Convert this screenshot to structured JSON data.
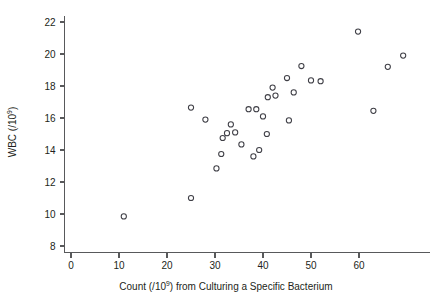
{
  "chart_data": {
    "type": "scatter",
    "title": "",
    "xlabel": "Count (/10⁹) from Culturing a Specific Bacterium",
    "xlabel_base": "Count (/10",
    "xlabel_sup": "9",
    "xlabel_tail": ") from Culturing a Specific Bacterium",
    "ylabel": "WBC (/10⁹)",
    "ylabel_base": "WBC (/10",
    "ylabel_sup": "9",
    "ylabel_tail": ")",
    "xlim": [
      0,
      70
    ],
    "ylim": [
      7.6,
      22.4
    ],
    "xticks": [
      0,
      10,
      20,
      30,
      40,
      50,
      60
    ],
    "yticks": [
      8,
      10,
      12,
      14,
      16,
      18,
      20,
      22
    ],
    "xtick_labels": [
      "0",
      "10",
      "20",
      "30",
      "40",
      "50",
      "60"
    ],
    "ytick_labels": [
      "8",
      "10",
      "12",
      "14",
      "16",
      "18",
      "20",
      "22"
    ],
    "grid": false,
    "legend": false,
    "marker": "open-circle",
    "marker_color": "#3f3f46",
    "marker_radius": 2.6,
    "series": [
      {
        "name": "WBC vs bacterial count",
        "points": [
          [
            11.0,
            9.85
          ],
          [
            25.0,
            11.0
          ],
          [
            25.0,
            16.65
          ],
          [
            28.0,
            15.9
          ],
          [
            30.3,
            12.85
          ],
          [
            31.3,
            13.75
          ],
          [
            31.6,
            14.75
          ],
          [
            32.5,
            15.05
          ],
          [
            33.3,
            15.6
          ],
          [
            34.2,
            15.1
          ],
          [
            35.5,
            14.35
          ],
          [
            37.0,
            16.55
          ],
          [
            38.0,
            13.6
          ],
          [
            38.6,
            16.55
          ],
          [
            39.2,
            14.0
          ],
          [
            40.0,
            16.1
          ],
          [
            40.8,
            15.0
          ],
          [
            41.0,
            17.3
          ],
          [
            42.0,
            17.9
          ],
          [
            42.6,
            17.4
          ],
          [
            45.0,
            18.5
          ],
          [
            45.4,
            15.85
          ],
          [
            46.4,
            17.6
          ],
          [
            48.0,
            19.25
          ],
          [
            50.0,
            18.35
          ],
          [
            52.0,
            18.3
          ],
          [
            59.8,
            21.4
          ],
          [
            63.0,
            16.45
          ],
          [
            66.0,
            19.2
          ],
          [
            69.2,
            19.9
          ]
        ]
      }
    ]
  }
}
